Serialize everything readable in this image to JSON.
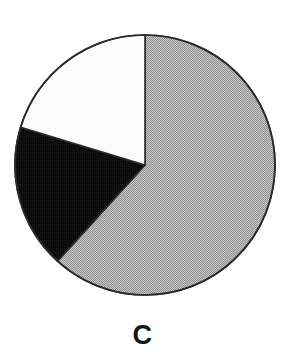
{
  "figure": {
    "label": "C",
    "background_color": "#ffffff",
    "outline_color": "#2b2b2b"
  },
  "chart_data": {
    "type": "pie",
    "title": "C",
    "subtitle": "",
    "xlabel": "",
    "ylabel": "",
    "legend_position": "none",
    "grid": false,
    "start_angle_deg": 0,
    "direction": "clockwise",
    "center": {
      "cx": 145,
      "cy": 165,
      "r": 130
    },
    "categories": [
      "Segment 1",
      "Segment 2",
      "Segment 3"
    ],
    "values": [
      61.8,
      17.9,
      20.3
    ],
    "units": "percent",
    "slices": [
      {
        "name": "Segment 1",
        "fill_name": "gray",
        "color": "#ababab",
        "value": 61.8,
        "start_angle_deg": 0,
        "end_angle_deg": 222.3
      },
      {
        "name": "Segment 2",
        "fill_name": "black",
        "color": "#111111",
        "value": 17.9,
        "start_angle_deg": 222.3,
        "end_angle_deg": 286.9
      },
      {
        "name": "Segment 3",
        "fill_name": "white",
        "color": "#fcfcfc",
        "value": 20.3,
        "start_angle_deg": 286.9,
        "end_angle_deg": 360
      }
    ]
  }
}
